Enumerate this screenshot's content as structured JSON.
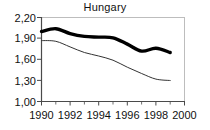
{
  "chart_data": {
    "type": "line",
    "title": "Hungary",
    "xlabel": "",
    "ylabel": "",
    "xlim": [
      1990,
      2000
    ],
    "ylim": [
      1.0,
      2.2
    ],
    "grid": false,
    "legend": "none",
    "decimal_separator": ",",
    "x_tick_labels": [
      "1990",
      "1992",
      "1994",
      "1996",
      "1998",
      "2000"
    ],
    "x_tick_values": [
      1990,
      1992,
      1994,
      1996,
      1998,
      2000
    ],
    "x_minor_tick_values": [
      1991,
      1993,
      1995,
      1997,
      1999
    ],
    "y_tick_labels": [
      "1,00",
      "1,30",
      "1,60",
      "1,90",
      "2,20"
    ],
    "y_tick_values": [
      1.0,
      1.3,
      1.6,
      1.9,
      2.2
    ],
    "x": [
      1990,
      1991,
      1992,
      1993,
      1994,
      1995,
      1996,
      1997,
      1998,
      1999
    ],
    "series": [
      {
        "name": "thick-series",
        "style": "thick-black",
        "color": "#000000",
        "width": 3.4,
        "values": [
          2.0,
          2.04,
          1.97,
          1.93,
          1.92,
          1.91,
          1.82,
          1.72,
          1.76,
          1.7
        ]
      },
      {
        "name": "thin-series",
        "style": "thin-black",
        "color": "#333333",
        "width": 1.0,
        "values": [
          1.87,
          1.86,
          1.78,
          1.7,
          1.65,
          1.59,
          1.49,
          1.4,
          1.32,
          1.3
        ]
      }
    ]
  },
  "axes": {
    "frame_color": "#b5b5b5",
    "axis_color": "#555555"
  }
}
